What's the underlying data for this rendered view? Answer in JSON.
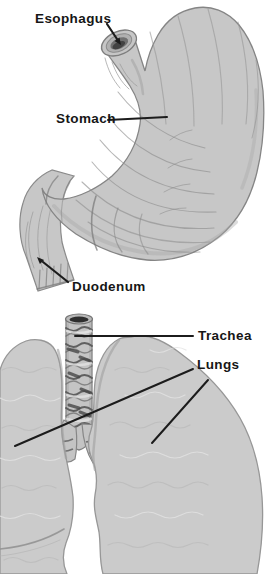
{
  "figure_type": "anatomical textbook illustration",
  "labels": {
    "esophagus": "Esophagus",
    "stomach": "Stomach",
    "duodenum": "Duodenum",
    "trachea": "Trachea",
    "lungs": "Lungs"
  },
  "colors": {
    "background": "#ffffff",
    "label_ink": "#161616",
    "leader_ink": "#1c1c1c",
    "organ_fill": "#c7c7c7",
    "lung_fill": "#cbcbcb",
    "organ_outline": "#8a8a8a",
    "texture_mid": "#969696",
    "texture_light": "#e2e2e2",
    "dark_accent": "#424242"
  }
}
